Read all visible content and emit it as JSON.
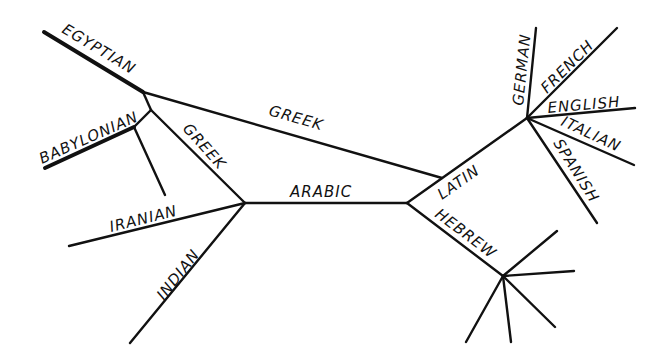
{
  "diagram": {
    "type": "language family tree (historical transmission of knowledge)",
    "labels": {
      "egyptian": "EGYPTIAN",
      "babylonian": "BABYLONIAN",
      "greek_upper": "GREEK",
      "greek_lower": "GREEK",
      "arabic": "ARABIC",
      "iranian": "IRANIAN",
      "indian": "INDIAN",
      "latin": "LATIN",
      "hebrew": "HEBREW",
      "german": "GERMAN",
      "french": "FRENCH",
      "english": "ENGLISH",
      "italian": "ITALIAN",
      "spanish": "SPANISH"
    },
    "colors": {
      "line": "#111111",
      "background": "#ffffff"
    }
  }
}
